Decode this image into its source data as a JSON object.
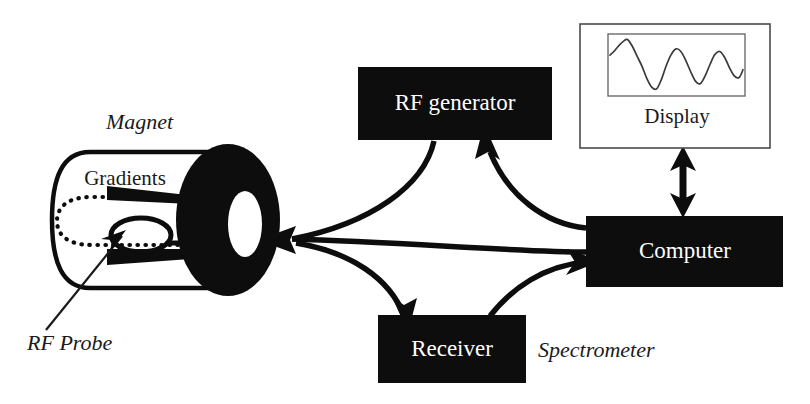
{
  "diagram": {
    "canvas": {
      "width": 810,
      "height": 404
    },
    "colors": {
      "block_fill": "#0d0d0d",
      "block_text": "#ffffff",
      "line": "#0d0d0d",
      "panel_border": "#4a4a4a",
      "background": "#ffffff"
    }
  },
  "blocks": {
    "rf_generator": {
      "label": "RF generator",
      "x": 358,
      "y": 67,
      "w": 194,
      "h": 73
    },
    "receiver": {
      "label": "Receiver",
      "x": 378,
      "y": 315,
      "w": 148,
      "h": 68
    },
    "computer": {
      "label": "Computer",
      "x": 586,
      "y": 216,
      "w": 197,
      "h": 71
    }
  },
  "display_panel": {
    "label": "Display",
    "outer": {
      "x": 580,
      "y": 24,
      "w": 190,
      "h": 124
    },
    "screen": {
      "x": 608,
      "y": 34,
      "w": 137,
      "h": 62
    }
  },
  "magnet": {
    "title_label": "Magnet",
    "gradients_label": "Gradients",
    "probe_label": "RF Probe"
  },
  "annotations": {
    "spectrometer_label": "Spectrometer"
  },
  "icons": {
    "magnet_bore": "magnet-bore-icon",
    "rf_coil_loop": "rf-coil-loop-icon",
    "gradient_coil": "gradient-coil-icon",
    "field_line": "magnetic-field-line-icon",
    "waveform": "fid-waveform-icon",
    "bidirectional_arrow": "bidirectional-arrow-icon"
  },
  "chart_data": {
    "type": "line",
    "title": "Display",
    "xlabel": "",
    "ylabel": "",
    "grid": false,
    "legend": null,
    "x": [
      0,
      4,
      9,
      14,
      18,
      23,
      28,
      33,
      38,
      43,
      48,
      53,
      58,
      63,
      68,
      73,
      78,
      83,
      88,
      93,
      98,
      103,
      108,
      113,
      118,
      123,
      128,
      133,
      137
    ],
    "y": [
      0.38,
      0.52,
      0.74,
      0.92,
      0.98,
      0.72,
      0.33,
      -0.05,
      -0.52,
      -0.85,
      -0.92,
      -0.55,
      -0.02,
      0.4,
      0.62,
      0.52,
      0.18,
      -0.25,
      -0.62,
      -0.72,
      -0.42,
      0.02,
      0.4,
      0.52,
      0.3,
      -0.1,
      -0.42,
      -0.48,
      -0.18
    ],
    "ylim": [
      -1,
      1
    ],
    "xlim": [
      0,
      137
    ]
  },
  "connections": [
    {
      "name": "rf-generator-to-magnet",
      "from": "rf_generator",
      "to": "magnet",
      "direction": "one-way"
    },
    {
      "name": "magnet-to-receiver",
      "from": "magnet",
      "to": "receiver",
      "direction": "one-way"
    },
    {
      "name": "computer-to-rf-generator",
      "from": "computer",
      "to": "rf_generator",
      "direction": "one-way"
    },
    {
      "name": "receiver-to-computer",
      "from": "receiver",
      "to": "computer",
      "direction": "one-way"
    },
    {
      "name": "computer-to-display",
      "from": "computer",
      "to": "display_panel",
      "direction": "two-way"
    }
  ]
}
